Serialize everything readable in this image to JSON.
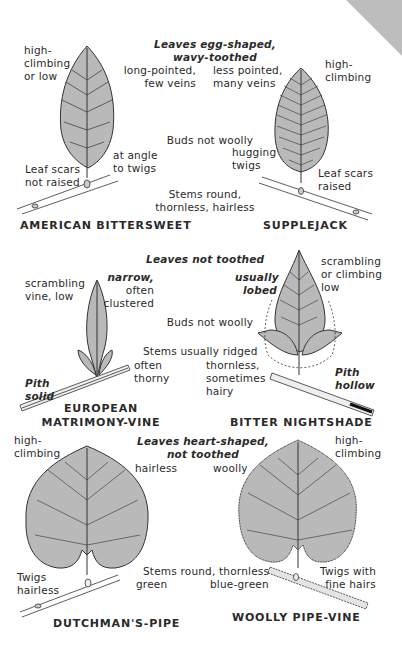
{
  "sections": [
    {
      "heading": "Leaves egg-shaped,\nwavy-toothed",
      "buds": "Buds not woolly",
      "stems": "Stems round,\nthornless, hairless",
      "left": {
        "name": "AMERICAN BITTERSWEET",
        "habit": "high-\nclimbing\nor low",
        "leaf": "long-pointed,\nfew veins",
        "buds_detail": "at angle\nto twigs",
        "scars": "Leaf scars\nnot raised"
      },
      "right": {
        "name": "SUPPLEJACK",
        "habit": "high-\nclimbing",
        "leaf": "less pointed,\nmany veins",
        "buds_detail": "hugging\ntwigs",
        "scars": "Leaf scars\nraised"
      }
    },
    {
      "heading": "Leaves not toothed",
      "buds": "Buds not woolly",
      "stems": "Stems usually ridged",
      "left": {
        "name": "EUROPEAN\nMATRIMONY-VINE",
        "habit": "scrambling\nvine, low",
        "leaf_bold": "narrow,",
        "leaf": "often\nclustered",
        "stems_detail": "often\nthorny",
        "pith": "Pith\nsolid"
      },
      "right": {
        "name": "BITTER NIGHTSHADE",
        "habit": "scrambling\nor climbing\nlow",
        "leaf_bold": "usually\nlobed",
        "stems_detail": "thornless,\nsometimes\nhairy",
        "pith": "Pith\nhollow"
      }
    },
    {
      "heading": "Leaves heart-shaped,\nnot toothed",
      "stems": "Stems round, thornless",
      "left": {
        "name": "DUTCHMAN'S-PIPE",
        "habit": "high-\nclimbing",
        "leaf": "hairless",
        "stem_color": "green",
        "twigs": "Twigs\nhairless"
      },
      "right": {
        "name": "WOOLLY PIPE-VINE",
        "habit": "high-\nclimbing",
        "leaf": "woolly",
        "stem_color": "blue-green",
        "twigs": "Twigs with\nfine hairs"
      }
    }
  ],
  "colors": {
    "leaf_fill": "#b9b9b9",
    "line": "#333333",
    "corner": "#bdbdbd"
  }
}
